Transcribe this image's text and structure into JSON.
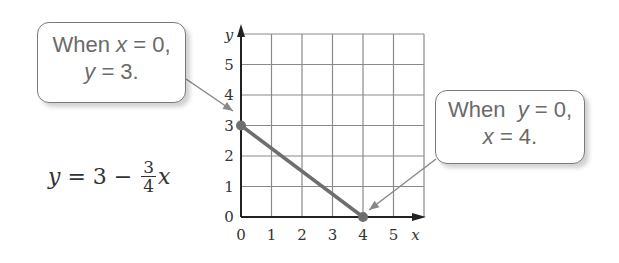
{
  "callouts": {
    "left": {
      "line1_prefix": "When ",
      "line1_var": "x",
      "line1_suffix": " = 0,",
      "line2_var": "y",
      "line2_suffix": " = 3."
    },
    "right": {
      "line1_prefix": "When  ",
      "line1_var": "y",
      "line1_suffix": " = 0,",
      "line2_var": "x",
      "line2_suffix": " = 4."
    }
  },
  "equation": {
    "lhs": "y",
    "mid": " = 3 − ",
    "numerator": "3",
    "denominator": "4",
    "var": "x"
  },
  "colors": {
    "grid": "#8a8a8a",
    "axis": "#222222",
    "line": "#6e6e6e",
    "point": "#6e6e6e",
    "pointer": "#888888"
  },
  "chart_data": {
    "type": "line",
    "title": "",
    "xlabel": "x",
    "ylabel": "y",
    "equation": "y = 3 - (3/4)x",
    "xlim": [
      0,
      6
    ],
    "ylim": [
      0,
      6
    ],
    "grid": true,
    "x_ticks": [
      "0",
      "1",
      "2",
      "3",
      "4",
      "5"
    ],
    "y_ticks": [
      "0",
      "1",
      "2",
      "3",
      "4",
      "5"
    ],
    "series": [
      {
        "name": "y = 3 - 3/4 x",
        "x": [
          0,
          4
        ],
        "y": [
          3,
          0
        ]
      }
    ],
    "points": [
      {
        "x": 0,
        "y": 3,
        "label": "When x = 0, y = 3."
      },
      {
        "x": 4,
        "y": 0,
        "label": "When y = 0, x = 4."
      }
    ],
    "annotations": [
      "When x = 0, y = 3.",
      "When y = 0, x = 4."
    ]
  }
}
